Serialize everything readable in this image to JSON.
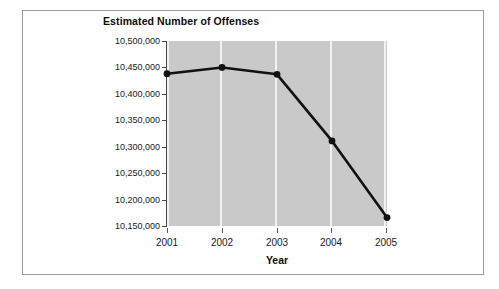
{
  "chart_data": {
    "type": "line",
    "title": "Estimated Number of Offenses",
    "xlabel": "Year",
    "ylabel": "",
    "categories": [
      "2001",
      "2002",
      "2003",
      "2004",
      "2005"
    ],
    "x": [
      2001,
      2002,
      2003,
      2004,
      2005
    ],
    "values": [
      10438000,
      10450000,
      10437000,
      10311000,
      10166000
    ],
    "series": [
      {
        "name": "Estimated Number of Offenses",
        "values": [
          10438000,
          10450000,
          10437000,
          10311000,
          10166000
        ]
      }
    ],
    "point_labels": [
      "10,438,000",
      "10,450,000",
      "10,437,000",
      "10,311,000",
      "10,166,000"
    ],
    "ylim": [
      10150000,
      10500000
    ],
    "ytick_values": [
      10500000,
      10450000,
      10400000,
      10350000,
      10300000,
      10250000,
      10200000,
      10150000
    ],
    "ytick_labels": [
      "10,500,000",
      "10,450,000",
      "10,400,000",
      "10,350,000",
      "10,300,000",
      "10,250,000",
      "10,200,000",
      "10,150,000"
    ],
    "xtick_labels": [
      "2001",
      "2002",
      "2003",
      "2004",
      "2005"
    ],
    "grid": "vertical-only",
    "legend": "none",
    "colors": {
      "plot_background": "#c9c9c9",
      "gridline": "#f2f2f2",
      "line": "#111111",
      "marker": "#111111",
      "axis": "#4a4a4a",
      "frame": "#9a9a9a",
      "page_background": "#ffffff",
      "text": "#1a1a1a"
    }
  }
}
